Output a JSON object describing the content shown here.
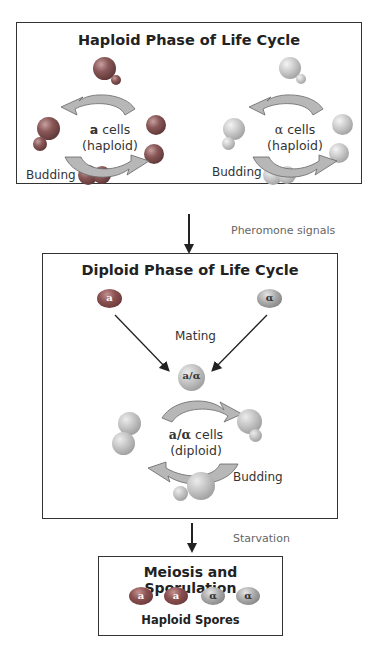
{
  "haploid_phase": {
    "title": "Haploid Phase of Life Cycle",
    "a_cycle": {
      "label_bold": "a",
      "label_rest": " cells",
      "sub": "(haploid)",
      "budding": "Budding"
    },
    "alpha_cycle": {
      "label_bold": "α",
      "label_rest": " cells",
      "sub": "(haploid)",
      "budding": "Budding"
    }
  },
  "transition_1": {
    "label": "Pheromone signals"
  },
  "diploid_phase": {
    "title": "Diploid Phase of Life Cycle",
    "left_cell": "a",
    "right_cell": "α",
    "mating": "Mating",
    "fused_cell": "a/α",
    "cycle": {
      "label_bold": "a/α",
      "label_rest": " cells",
      "sub": "(diploid)",
      "budding": "Budding"
    }
  },
  "transition_2": {
    "label": "Starvation"
  },
  "sporulation": {
    "title": "Meiosis and Sporulation",
    "spores": [
      "a",
      "a",
      "α",
      "α"
    ],
    "caption": "Haploid Spores"
  },
  "colors": {
    "a_cell": "#7a4848",
    "alpha_cell": "#bdbdbd",
    "diploid_cell": "#b5b5b5",
    "arrow_fill": "#b0b0b0",
    "border": "#333333"
  }
}
